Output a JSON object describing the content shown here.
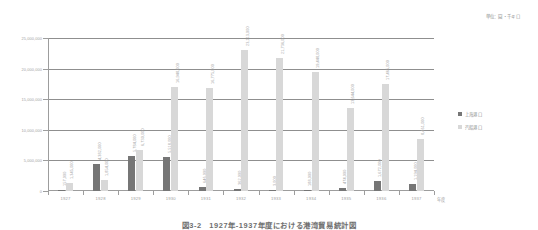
{
  "unit_note": "単位：圓・千キロ",
  "legend": {
    "position": "right",
    "entries": [
      {
        "label": "上海港口",
        "color": "#767676",
        "marker": "square"
      },
      {
        "label": "汽船港口",
        "color": "#d8d8d8",
        "marker": "square"
      }
    ]
  },
  "axis": {
    "x_title": "年度",
    "y_ticks": [
      "0",
      "5,000,000",
      "10,000,000",
      "15,000,000",
      "20,000,000",
      "25,000,000"
    ]
  },
  "caption": "図3-2　1927年-1937年度における港湾貿易統計図",
  "chart_data": {
    "type": "bar",
    "title": "",
    "xlabel": "年度",
    "ylabel": "",
    "ylim": [
      0,
      25000000
    ],
    "ytick_interval": 5000000,
    "grid": true,
    "legend_position": "right",
    "categories": [
      "1927",
      "1928",
      "1929",
      "1930",
      "1931",
      "1932",
      "1933",
      "1934",
      "1935",
      "1936",
      "1937"
    ],
    "series": [
      {
        "name": "上海港口",
        "color": "#767676",
        "values": [
          157000,
          4382000,
          5784000,
          5518000,
          646000,
          362000,
          3000,
          188000,
          474000,
          1672000,
          1194000
        ],
        "labels": [
          "157,000",
          "4,382,000",
          "5,784,000",
          "5,518,000",
          "646,000",
          "362,000",
          "3,000",
          "188,000",
          "474,000",
          "1,672,000",
          "1,194,000"
        ]
      },
      {
        "name": "汽船港口",
        "color": "#d8d8d8",
        "values": [
          1345000,
          1854000,
          6730000,
          16948000,
          16775000,
          23113000,
          21736000,
          19448000,
          13644000,
          17465000,
          8461000
        ],
        "labels": [
          "1,345,000",
          "1,854,000",
          "6,730,000",
          "16,948,000",
          "16,775,000",
          "23,113,000",
          "21,736,000",
          "19,448,000",
          "13,644,000",
          "17,465,000",
          "8,461,000"
        ]
      }
    ]
  }
}
